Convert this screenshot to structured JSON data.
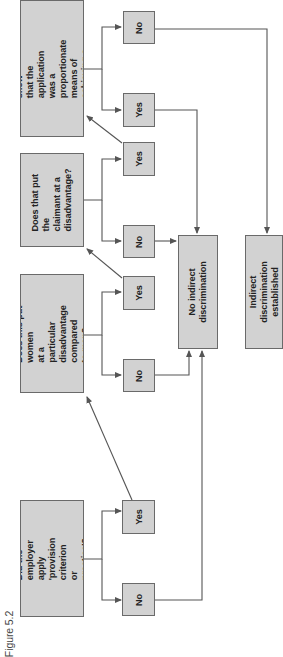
{
  "figure_label": "Figure 5.2",
  "colors": {
    "box_fill": "#d2d2d2",
    "box_border": "#6a6a6a",
    "line": "#555555",
    "text": "#222222"
  },
  "questions": [
    {
      "id": "q1",
      "text": "Did the employer\napply 'provision criterion\nor practice'?"
    },
    {
      "id": "q2",
      "text": "Does this put women\nat a particular\ndisadvantage compared\nto men?"
    },
    {
      "id": "q3",
      "text": "Does that put the\nclaimant at a\ndisadvantage?"
    },
    {
      "id": "q4",
      "text": "Can the employer show\nthat the application was a\nproportionate means of\nachieving a legitimate aim?"
    }
  ],
  "answers": {
    "q1": {
      "no": "No",
      "yes": "Yes"
    },
    "q2": {
      "no": "No",
      "yes": "Yes"
    },
    "q3": {
      "no": "No",
      "yes": "Yes"
    },
    "q4": {
      "yes": "Yes",
      "no": "No"
    }
  },
  "results": {
    "no_discrimination": "No indirect\ndiscrimination",
    "discrimination_established": "Indirect discrimination\nestablished"
  }
}
